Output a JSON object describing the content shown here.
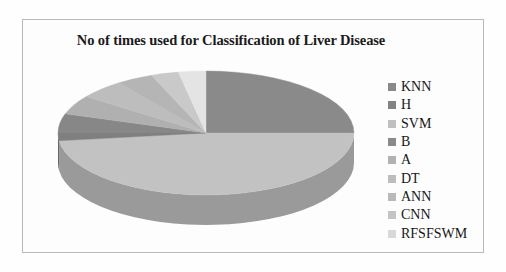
{
  "figure": {
    "background_color": "#fefefe",
    "frame_color": "#b9b9b9"
  },
  "chart_data": {
    "type": "pie",
    "title": "No of times used for Classification of Liver Disease",
    "subtitle": "",
    "xlabel": "",
    "ylabel": "",
    "three_d": true,
    "start_angle_clock": "12 o'clock",
    "direction": "clockwise",
    "legend_position": "right",
    "grid": false,
    "categories": [
      "KNN",
      "H",
      "SVM",
      "B",
      "A",
      "DT",
      "ANN",
      "CNN",
      "RFSFSWM"
    ],
    "values": [
      25,
      48,
      2,
      5,
      5,
      5,
      4,
      3,
      3
    ],
    "colors": [
      "#8a8a8a",
      "#c2c2c2",
      "#7f7f7f",
      "#878787",
      "#b0b0b0",
      "#bdbdbd",
      "#b5b5b5",
      "#c9c9c9",
      "#e4e4e4"
    ],
    "side_colors": [
      "#6f6f6f",
      "#9a9a9a",
      "#676767",
      "#6d6d6d",
      "#8c8c8c",
      "#969696",
      "#909090",
      "#a2a2a2",
      "#b6b6b6"
    ],
    "slices": [
      {
        "label": "KNN",
        "value": 25,
        "color": "#8a8a8a",
        "side_color": "#6f6f6f"
      },
      {
        "label": "H",
        "value": 48,
        "color": "#c2c2c2",
        "side_color": "#9a9a9a"
      },
      {
        "label": "SVM",
        "value": 2,
        "color": "#7f7f7f",
        "side_color": "#676767"
      },
      {
        "label": "B",
        "value": 5,
        "color": "#878787",
        "side_color": "#6d6d6d"
      },
      {
        "label": "A",
        "value": 5,
        "color": "#b0b0b0",
        "side_color": "#8c8c8c"
      },
      {
        "label": "DT",
        "value": 5,
        "color": "#bdbdbd",
        "side_color": "#969696"
      },
      {
        "label": "ANN",
        "value": 4,
        "color": "#b5b5b5",
        "side_color": "#909090"
      },
      {
        "label": "CNN",
        "value": 3,
        "color": "#c9c9c9",
        "side_color": "#a2a2a2"
      },
      {
        "label": "RFSFSWM",
        "value": 3,
        "color": "#e4e4e4",
        "side_color": "#b6b6b6"
      }
    ]
  },
  "legend": {
    "items": [
      {
        "label": "KNN",
        "color": "#8a8a8a"
      },
      {
        "label": "H",
        "color": "#838383"
      },
      {
        "label": "SVM",
        "color": "#c0c0c0"
      },
      {
        "label": "B",
        "color": "#8a8a8a"
      },
      {
        "label": "A",
        "color": "#b2b2b2"
      },
      {
        "label": "DT",
        "color": "#bdbdbd"
      },
      {
        "label": "ANN",
        "color": "#b9b9b9"
      },
      {
        "label": "CNN",
        "color": "#c4c4c4"
      },
      {
        "label": "RFSFSWM",
        "color": "#d8d8d8"
      }
    ]
  }
}
